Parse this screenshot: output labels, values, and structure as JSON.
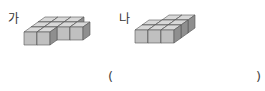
{
  "figures": [
    {
      "label": "가",
      "description": "cube-stack-shape-a"
    },
    {
      "label": "나",
      "description": "cube-stack-shape-b"
    }
  ],
  "answer": {
    "open_paren": "(",
    "close_paren": ")",
    "value": ""
  },
  "colors": {
    "top": "#d6d6d6",
    "front": "#bdbdbd",
    "side": "#8e8e8e",
    "edge": "#555555"
  }
}
